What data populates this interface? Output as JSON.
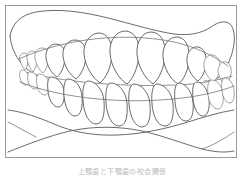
{
  "figure": {
    "caption": "上顎歯と下顎歯の咬合関係",
    "frame": {
      "border_color": "#9a9a9a",
      "background_color": "#ffffff",
      "x": 5,
      "y": 5,
      "width": 232,
      "height": 153
    },
    "line_color": "#5a5a5a",
    "tooth_fill": "#ffffff",
    "tooth_stroke": "#4f4f4f"
  },
  "illustration": {
    "type": "line-drawing",
    "subject": "dental-occlusion-lateral",
    "parts": [
      {
        "name": "maxilla-outline",
        "label": "Upper jaw (maxilla) soft-tissue outline"
      },
      {
        "name": "mandible-outline",
        "label": "Lower jaw (mandible) soft-tissue outline"
      },
      {
        "name": "upper-teeth-row",
        "label": "Maxillary dental arch",
        "tooth_count": 12
      },
      {
        "name": "lower-teeth-row",
        "label": "Mandibular dental arch",
        "tooth_count": 12
      },
      {
        "name": "occlusal-plane",
        "label": "Occlusal contact line"
      },
      {
        "name": "chin-contour",
        "label": "Chin and neck contour lines"
      }
    ]
  }
}
